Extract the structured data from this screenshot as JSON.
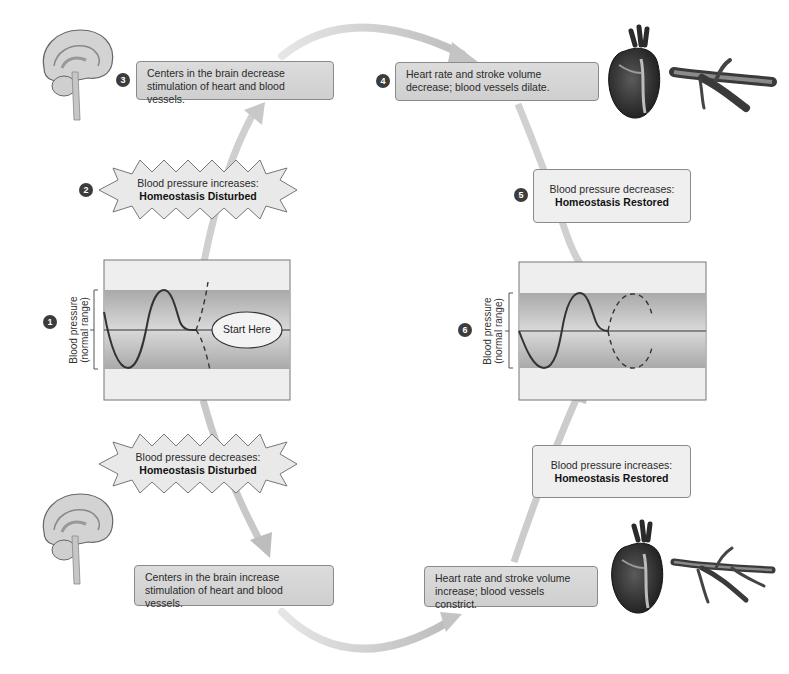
{
  "diagram": {
    "colors": {
      "arrow": "#c8c8c8",
      "box_grey": "#d6d6d6",
      "box_light": "#efefef",
      "badge": "#3c3c3c",
      "band": "#b5b5b5",
      "curve": "#333333"
    },
    "steps": [
      {
        "number": "1",
        "label_line1": "Blood pressure",
        "label_line2": "(normal range)",
        "start_label": "Start Here"
      },
      {
        "number": "2",
        "line1": "Blood pressure increases:",
        "line2": "Homeostasis Disturbed"
      },
      {
        "number": "3",
        "text": "Centers in the brain decrease stimulation of heart and blood vessels."
      },
      {
        "number": "4",
        "text": "Heart rate and stroke volume decrease; blood vessels dilate."
      },
      {
        "number": "5",
        "line1": "Blood pressure decreases:",
        "line2": "Homeostasis Restored"
      },
      {
        "number": "6",
        "label_line1": "Blood pressure",
        "label_line2": "(normal range)"
      }
    ],
    "lower_path": {
      "disturbed": {
        "line1": "Blood pressure decreases:",
        "line2": "Homeostasis Disturbed"
      },
      "brain": {
        "text": "Centers in the brain increase stimulation of heart and blood vessels."
      },
      "effectors": {
        "text": "Heart rate and stroke volume increase; blood vessels constrict."
      },
      "restored": {
        "line1": "Blood pressure increases:",
        "line2": "Homeostasis Restored"
      }
    },
    "icons": [
      "brain-icon",
      "heart-icon",
      "blood-vessel-icon"
    ]
  }
}
